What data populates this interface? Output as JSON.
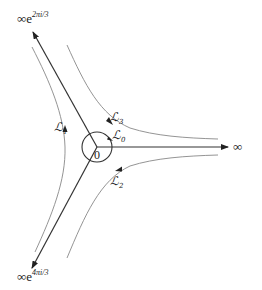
{
  "diagram": {
    "type": "contour-diagram",
    "origin": {
      "label": "0",
      "x": 97,
      "y": 147
    },
    "small_circle": {
      "cx": 97,
      "cy": 147,
      "r": 15,
      "label": "ℒ",
      "subscript": "0"
    },
    "rays": [
      {
        "name": "ray-right",
        "end_label": "∞",
        "end_exp": ""
      },
      {
        "name": "ray-upper-left",
        "end_label": "∞e",
        "end_exp": "2πi/3"
      },
      {
        "name": "ray-lower-left",
        "end_label": "∞e",
        "end_exp": "4πi/3"
      }
    ],
    "contours": [
      {
        "name": "L1",
        "label": "ℒ",
        "subscript": "1"
      },
      {
        "name": "L2",
        "label": "ℒ",
        "subscript": "2"
      },
      {
        "name": "L3",
        "label": "ℒ",
        "subscript": "3"
      }
    ],
    "colors": {
      "ray": "#222222",
      "contour": "#888888",
      "text": "#222222"
    }
  }
}
